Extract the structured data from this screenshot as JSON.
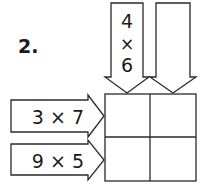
{
  "problem": {
    "number": "2.",
    "column_arrows": [
      {
        "top": "4",
        "op": "×",
        "bottom": "6"
      },
      {
        "top": "",
        "op": "",
        "bottom": ""
      }
    ],
    "row_arrows": [
      {
        "label": "3 × 7"
      },
      {
        "label": "9 × 5"
      }
    ],
    "grid": {
      "rows": 2,
      "cols": 2,
      "cells": [
        [
          "",
          ""
        ],
        [
          "",
          ""
        ]
      ]
    },
    "colors": {
      "stroke": "#2a2a2a",
      "text": "#1a1a1a",
      "background": "#ffffff"
    }
  }
}
